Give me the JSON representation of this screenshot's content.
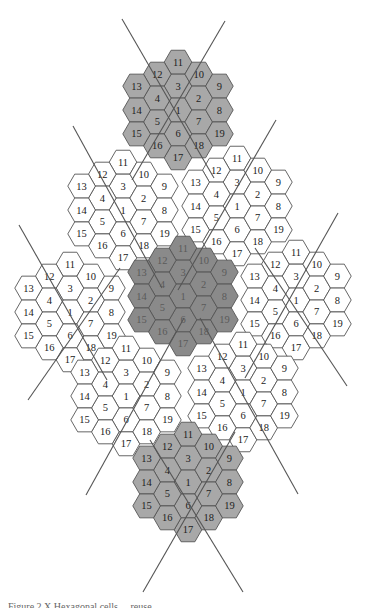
{
  "figure": {
    "caption_partial": "Figure 2.X   Hexagonal cells ... reuse ...",
    "cells_per_cluster": 19,
    "cluster_layout": [
      {
        "q": 0,
        "r": -2,
        "label": "11"
      },
      {
        "q": 0,
        "r": -1,
        "label": "3"
      },
      {
        "q": 0,
        "r": 0,
        "label": "1"
      },
      {
        "q": 0,
        "r": 1,
        "label": "6"
      },
      {
        "q": 0,
        "r": 2,
        "label": "17"
      },
      {
        "q": 1,
        "r": -2,
        "label": "10"
      },
      {
        "q": 1,
        "r": -1,
        "label": "2"
      },
      {
        "q": 1,
        "r": 0,
        "label": "7"
      },
      {
        "q": 1,
        "r": 1,
        "label": "18"
      },
      {
        "q": 2,
        "r": -2,
        "label": "9"
      },
      {
        "q": 2,
        "r": -1,
        "label": "8"
      },
      {
        "q": 2,
        "r": 0,
        "label": "19"
      },
      {
        "q": -1,
        "r": -1,
        "label": "12"
      },
      {
        "q": -1,
        "r": 0,
        "label": "4"
      },
      {
        "q": -1,
        "r": 1,
        "label": "5"
      },
      {
        "q": -1,
        "r": 2,
        "label": "16"
      },
      {
        "q": -2,
        "r": 0,
        "label": "13"
      },
      {
        "q": -2,
        "r": 1,
        "label": "14"
      },
      {
        "q": -2,
        "r": 2,
        "label": "15"
      }
    ],
    "clusters": [
      {
        "name": "top-cluster",
        "cx": 178,
        "cy": 110,
        "shade": "light"
      },
      {
        "name": "upper-left-cluster",
        "cx": 123,
        "cy": 210,
        "shade": "white"
      },
      {
        "name": "upper-right-cluster",
        "cx": 237,
        "cy": 206,
        "shade": "white"
      },
      {
        "name": "left-cluster",
        "cx": 70,
        "cy": 312,
        "shade": "white"
      },
      {
        "name": "right-cluster",
        "cx": 296,
        "cy": 300,
        "shade": "white"
      },
      {
        "name": "lower-left-cluster",
        "cx": 126,
        "cy": 396,
        "shade": "white"
      },
      {
        "name": "lower-right-cluster",
        "cx": 243,
        "cy": 392,
        "shade": "white"
      },
      {
        "name": "center-cluster",
        "cx": 183,
        "cy": 296,
        "shade": "dark"
      },
      {
        "name": "bottom-cluster",
        "cx": 188,
        "cy": 482,
        "shade": "light"
      }
    ],
    "axes": [
      {
        "name": "top-left-axis",
        "x1": 122,
        "y1": 19,
        "x2": 214,
        "y2": 178
      },
      {
        "name": "top-right-axis",
        "x1": 225,
        "y1": 21,
        "x2": 132,
        "y2": 180
      },
      {
        "name": "upper-left-axis",
        "x1": 73,
        "y1": 126,
        "x2": 162,
        "y2": 288
      },
      {
        "name": "upper-mid-axis",
        "x1": 276,
        "y1": 120,
        "x2": 178,
        "y2": 290
      },
      {
        "name": "far-left-axis",
        "x1": 19,
        "y1": 225,
        "x2": 107,
        "y2": 380
      },
      {
        "name": "left-cross-axis",
        "x1": 120,
        "y1": 268,
        "x2": 28,
        "y2": 400
      },
      {
        "name": "right-cross-axis",
        "x1": 338,
        "y1": 213,
        "x2": 245,
        "y2": 378
      },
      {
        "name": "right-desc-axis",
        "x1": 255,
        "y1": 248,
        "x2": 347,
        "y2": 386
      },
      {
        "name": "lower-left-axis",
        "x1": 86,
        "y1": 495,
        "x2": 184,
        "y2": 318
      },
      {
        "name": "lower-right-axis",
        "x1": 298,
        "y1": 494,
        "x2": 200,
        "y2": 318
      },
      {
        "name": "bottom-left-axis",
        "x1": 143,
        "y1": 592,
        "x2": 235,
        "y2": 432
      },
      {
        "name": "bottom-right-axis",
        "x1": 243,
        "y1": 592,
        "x2": 150,
        "y2": 440
      }
    ],
    "colors": {
      "white_cell": "#ffffff",
      "light_cell": "#a8a8a8",
      "dark_cell": "#8a8a8a",
      "stroke": "#555555"
    }
  }
}
